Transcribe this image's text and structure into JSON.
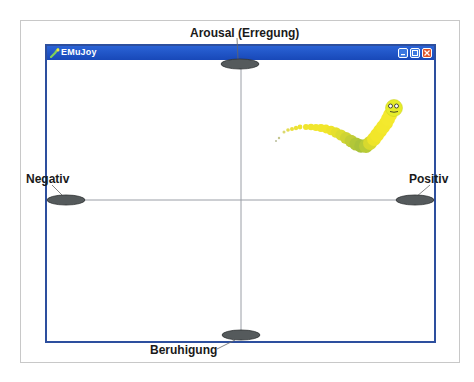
{
  "window": {
    "title": "EMuJoy",
    "buttons": [
      "minimize",
      "maximize",
      "close"
    ]
  },
  "axes": {
    "top_label": "Arousal (Erregung)",
    "bottom_label": "Beruhigung",
    "left_label": "Negativ",
    "right_label": "Positiv"
  },
  "colors": {
    "titlebar": "#1f56c6",
    "window_border": "#2d4f9e",
    "handle": "#555a5c",
    "worm_yellow": "#f2e62a",
    "worm_green": "#9ec43a"
  }
}
